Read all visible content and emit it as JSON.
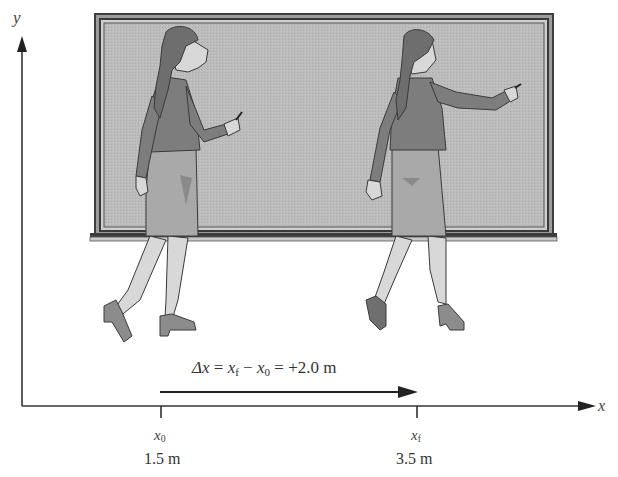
{
  "figure": {
    "axes": {
      "x_label": "x",
      "y_label": "y"
    },
    "displacement": {
      "symbol": "Δx",
      "equals": "=",
      "final_symbol": "x",
      "final_sub": "f",
      "minus": "−",
      "initial_symbol": "x",
      "initial_sub": "0",
      "equals2": "=",
      "value": "+2.0 m"
    },
    "ticks": [
      {
        "symbol": "x",
        "sub": "0",
        "value": "1.5 m"
      },
      {
        "symbol": "x",
        "sub": "f",
        "value": "3.5 m"
      }
    ],
    "colors": {
      "board_fill": "#b9b9b9",
      "board_frame": "#4a4a4a",
      "skin": "#d9d9d9",
      "sweater": "#7f7f7f",
      "skirt": "#a8a8a8",
      "hair": "#6a6a6a",
      "axis": "#333333"
    }
  }
}
